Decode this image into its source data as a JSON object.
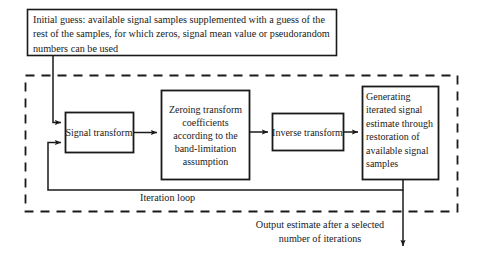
{
  "diagram": {
    "colors": {
      "stroke": "#1a1a1a",
      "text": "#1a1a1a",
      "background": "#ffffff"
    },
    "nodes": {
      "initial_guess": {
        "label": "Initial guess: available signal samples supplemented with a guess of the rest of the samples, for which zeros, signal mean value or pseudorandom numbers can be used"
      },
      "signal_transform": {
        "label": "Signal transform"
      },
      "zeroing": {
        "label": "Zeroing transform coefficients according to the band-limitation assumption"
      },
      "inverse_transform": {
        "label": "Inverse transform"
      },
      "generating": {
        "label": "Generating iterated signal estimate through restoration of available signal samples"
      }
    },
    "labels": {
      "iteration_loop": "Iteration loop",
      "output_estimate": "Output estimate after a selected number of iterations"
    }
  }
}
